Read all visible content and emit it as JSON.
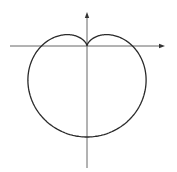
{
  "figure": {
    "type": "polar-curve",
    "corner_label": "",
    "colors": {
      "curve": "#2a2a2a",
      "axis": "#555555",
      "background": "#ffffff"
    }
  },
  "geometry": {
    "origin": [
      87,
      46
    ],
    "a": 45.5,
    "x_axis": {
      "from": 10,
      "to": 165,
      "arrow": "right"
    },
    "y_axis": {
      "from": 168,
      "to": 12,
      "arrow": "up"
    }
  }
}
